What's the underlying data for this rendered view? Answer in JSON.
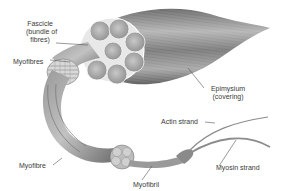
{
  "diagram": {
    "labels": {
      "fascicle": [
        "Fascicle",
        "(bundle of",
        "fibres)"
      ],
      "myofibres": "Myofibres",
      "epimysium": [
        "Epimysium",
        "(covering)"
      ],
      "actin": "Actin strand",
      "myofibre": "Myofibre",
      "myofibril": "Myofibril",
      "myosin": "Myosin strand"
    },
    "colors": {
      "background": "#ffffff",
      "muscle_dark": "#5a5a5a",
      "muscle_mid": "#9a9a9a",
      "muscle_light": "#cfcfcf",
      "label_text": "#3a3a3a",
      "leader_line": "#555555"
    }
  }
}
